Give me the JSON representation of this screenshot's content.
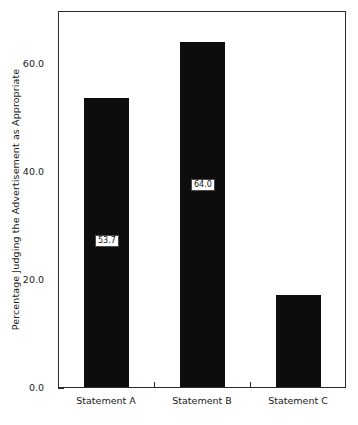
{
  "chart_data": {
    "type": "bar",
    "title": "",
    "subtitle": "",
    "xlabel": "",
    "ylabel": "Percentage Judging the Advertisement as Appropriate",
    "categories": [
      "Statement A",
      "Statement B",
      "Statement C"
    ],
    "values": [
      53.7,
      64.0,
      17.2
    ],
    "value_labels": [
      "53.7",
      "64.0",
      "17.2"
    ],
    "ylim": [
      0.0,
      69.8
    ],
    "y_ticks": [
      0.0,
      20.0,
      40.0,
      60.0
    ],
    "y_tick_labels": [
      "0.0",
      "20.0",
      "40.0",
      "60.0"
    ],
    "grid": false,
    "legend": null,
    "bar_color": "#0d0d0d",
    "frame_color": "#2b2b2b",
    "background": "#ffffff",
    "annotations": []
  },
  "axis": {
    "y_title": "Percentage Judging the Advertisement as Appropriate"
  }
}
